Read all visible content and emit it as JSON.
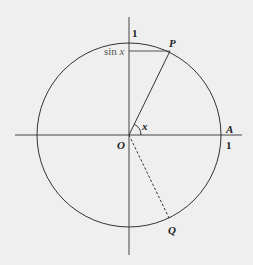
{
  "diagram": {
    "colors": {
      "background": "#efefef",
      "stroke": "#333333",
      "text": "#222222"
    },
    "labels": {
      "y_axis_tick": "1",
      "x_axis_tick": "1",
      "sin_label_fn": "sin",
      "sin_label_var": "x",
      "point_P": "P",
      "point_Q": "Q",
      "point_A": "A",
      "origin": "O",
      "angle": "x"
    },
    "elements": [
      "unit circle centered at O",
      "horizontal axis through O to A",
      "vertical axis through O",
      "solid radius O to P",
      "dashed segment O to Q",
      "horizontal segment from vertical axis to P at height sin x",
      "angle arc x between OA and OP"
    ]
  }
}
